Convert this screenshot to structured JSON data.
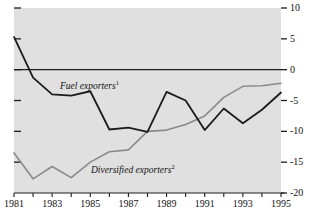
{
  "chart_data": {
    "type": "line",
    "title": "",
    "xlabel": "",
    "ylabel": "",
    "xlim": [
      1981,
      1995
    ],
    "ylim": [
      -20,
      10
    ],
    "grid": false,
    "legend_position": "inline-annotation",
    "zero_line": 0,
    "x": [
      1981,
      1982,
      1983,
      1984,
      1985,
      1986,
      1987,
      1988,
      1989,
      1990,
      1991,
      1992,
      1993,
      1994,
      1995
    ],
    "xtick_labels": [
      "1981",
      "",
      "1983",
      "",
      "1985",
      "",
      "1987",
      "",
      "1989",
      "",
      "1991",
      "",
      "1993",
      "",
      "1995"
    ],
    "ytick_values": [
      10,
      5,
      0,
      -5,
      -10,
      -15,
      -20
    ],
    "ytick_labels": [
      "10",
      "5",
      "0",
      "-5",
      "-10",
      "-15",
      "-20"
    ],
    "series": [
      {
        "name": "Fuel exporters",
        "footnote": "1",
        "label_text": "Fuel exporters",
        "color": "#1c1c1c",
        "width": 1.8,
        "values": [
          5.3,
          -1.3,
          -4.0,
          -4.2,
          -3.5,
          -9.7,
          -9.4,
          -10.1,
          -3.6,
          -5.0,
          -9.8,
          -6.3,
          -8.7,
          -6.5,
          -3.7
        ]
      },
      {
        "name": "Diversified exporters",
        "footnote": "2",
        "label_text": "Diversified exporters",
        "color": "#8a8a8a",
        "width": 1.6,
        "values": [
          -13.5,
          -17.7,
          -15.7,
          -17.5,
          -15.0,
          -13.3,
          -13.0,
          -10.0,
          -9.8,
          -8.9,
          -7.5,
          -4.5,
          -2.7,
          -2.6,
          -2.2
        ]
      }
    ]
  },
  "annotations": {
    "fuel_label": "Fuel exporters",
    "fuel_footnote": "1",
    "diversified_label": "Diversified exporters",
    "diversified_footnote": "2"
  },
  "colors": {
    "plot_background": "#e0e0e0",
    "page_background": "#ffffff",
    "axis": "#1c1c1c",
    "fuel_line": "#1c1c1c",
    "diversified_line": "#8a8a8a"
  }
}
